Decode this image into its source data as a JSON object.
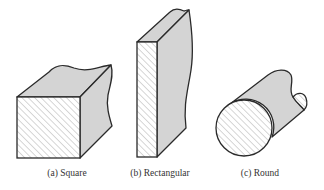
{
  "figure": {
    "fill_color": "#d4d4d4",
    "stroke_color": "#2a2a2a",
    "hatch_color": "#9a9a9a",
    "cross_sections": [
      {
        "id": "a",
        "label": "(a) Square",
        "shape": "square-bar"
      },
      {
        "id": "b",
        "label": "(b) Rectangular",
        "shape": "rectangular-plate"
      },
      {
        "id": "c",
        "label": "(c) Round",
        "shape": "round-bar"
      }
    ]
  }
}
